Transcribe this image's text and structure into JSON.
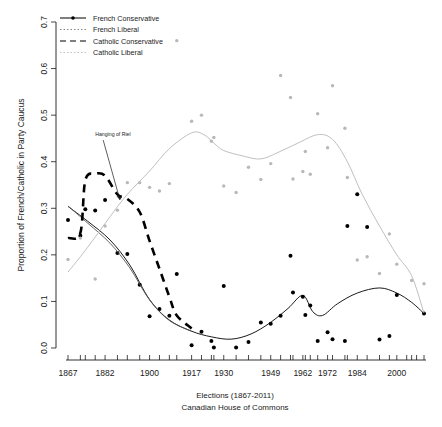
{
  "chart_data": {
    "type": "scatter",
    "title": "",
    "xlabel": "Elections (1867-2011)",
    "xlabel_line2": "Canadian House of Commons",
    "ylabel": "Proportion of French/Catholic in Party Caucus",
    "xlim": [
      1867,
      2011
    ],
    "ylim": [
      0.0,
      0.7
    ],
    "grid": false,
    "legend_position": "top-left",
    "y_ticks": [
      "0.0",
      "0.1",
      "0.2",
      "0.3",
      "0.4",
      "0.5",
      "0.6",
      "0.7"
    ],
    "y_tick_values": [
      0.0,
      0.1,
      0.2,
      0.3,
      0.4,
      0.5,
      0.6,
      0.7
    ],
    "x_tick_labels": [
      "1867",
      "1882",
      "1900",
      "1917",
      "1930",
      "1949",
      "1962",
      "1972",
      "1984",
      "2000"
    ],
    "x_tick_label_values": [
      1867,
      1882,
      1900,
      1917,
      1930,
      1949,
      1962,
      1972,
      1984,
      2000
    ],
    "election_years": [
      1867,
      1872,
      1874,
      1878,
      1882,
      1887,
      1891,
      1896,
      1900,
      1904,
      1908,
      1911,
      1917,
      1921,
      1925,
      1926,
      1930,
      1935,
      1940,
      1945,
      1949,
      1953,
      1957,
      1958,
      1962,
      1963,
      1965,
      1968,
      1972,
      1974,
      1979,
      1980,
      1984,
      1988,
      1993,
      1997,
      2000,
      2004,
      2006,
      2008,
      2011
    ],
    "annotations": [
      {
        "text": "Hanging of Riel",
        "x": 1878,
        "y": 0.455,
        "arrow_to_x": 1888,
        "arrow_to_y": 0.318
      }
    ],
    "series": [
      {
        "name": "French Conservative",
        "color": "#000000",
        "line_style": "solid",
        "marker": "filled-circle",
        "points": [
          {
            "x": 1867,
            "y": 0.275
          },
          {
            "x": 1872,
            "y": 0.241
          },
          {
            "x": 1874,
            "y": 0.298
          },
          {
            "x": 1878,
            "y": 0.295
          },
          {
            "x": 1882,
            "y": 0.318
          },
          {
            "x": 1887,
            "y": 0.204
          },
          {
            "x": 1891,
            "y": 0.202
          },
          {
            "x": 1896,
            "y": 0.136
          },
          {
            "x": 1900,
            "y": 0.068
          },
          {
            "x": 1904,
            "y": 0.084
          },
          {
            "x": 1908,
            "y": 0.069
          },
          {
            "x": 1911,
            "y": 0.159
          },
          {
            "x": 1917,
            "y": 0.006
          },
          {
            "x": 1921,
            "y": 0.035
          },
          {
            "x": 1925,
            "y": 0.015
          },
          {
            "x": 1926,
            "y": 0.001
          },
          {
            "x": 1930,
            "y": 0.133
          },
          {
            "x": 1935,
            "y": 0.001
          },
          {
            "x": 1940,
            "y": 0.013
          },
          {
            "x": 1945,
            "y": 0.055
          },
          {
            "x": 1949,
            "y": 0.052
          },
          {
            "x": 1953,
            "y": 0.069
          },
          {
            "x": 1957,
            "y": 0.198
          },
          {
            "x": 1958,
            "y": 0.119
          },
          {
            "x": 1962,
            "y": 0.11
          },
          {
            "x": 1963,
            "y": 0.071
          },
          {
            "x": 1965,
            "y": 0.091
          },
          {
            "x": 1968,
            "y": 0.015
          },
          {
            "x": 1972,
            "y": 0.034
          },
          {
            "x": 1974,
            "y": 0.019
          },
          {
            "x": 1979,
            "y": 0.015
          },
          {
            "x": 1980,
            "y": 0.262
          },
          {
            "x": 1984,
            "y": 0.33
          },
          {
            "x": 1988,
            "y": 0.26
          },
          {
            "x": 1993,
            "y": 0.018
          },
          {
            "x": 1997,
            "y": 0.026
          },
          {
            "x": 2000,
            "y": 0.114
          },
          {
            "x": 2011,
            "y": 0.074
          }
        ],
        "smooth": [
          {
            "x": 1867,
            "y": 0.304
          },
          {
            "x": 1875,
            "y": 0.272
          },
          {
            "x": 1884,
            "y": 0.232
          },
          {
            "x": 1892,
            "y": 0.178
          },
          {
            "x": 1900,
            "y": 0.104
          },
          {
            "x": 1908,
            "y": 0.06
          },
          {
            "x": 1917,
            "y": 0.036
          },
          {
            "x": 1925,
            "y": 0.024
          },
          {
            "x": 1933,
            "y": 0.019
          },
          {
            "x": 1941,
            "y": 0.03
          },
          {
            "x": 1949,
            "y": 0.055
          },
          {
            "x": 1956,
            "y": 0.085
          },
          {
            "x": 1962,
            "y": 0.113
          },
          {
            "x": 1966,
            "y": 0.078
          },
          {
            "x": 1970,
            "y": 0.07
          },
          {
            "x": 1976,
            "y": 0.095
          },
          {
            "x": 1984,
            "y": 0.118
          },
          {
            "x": 1993,
            "y": 0.129
          },
          {
            "x": 2000,
            "y": 0.118
          },
          {
            "x": 2006,
            "y": 0.098
          },
          {
            "x": 2011,
            "y": 0.074
          }
        ]
      },
      {
        "name": "French Liberal",
        "color": "#555555",
        "line_style": "solid",
        "marker": "small-dot",
        "points": [],
        "smooth": [
          {
            "x": 1867,
            "y": 0.305
          },
          {
            "x": 1875,
            "y": 0.268
          },
          {
            "x": 1884,
            "y": 0.225
          },
          {
            "x": 1892,
            "y": 0.172
          },
          {
            "x": 1900,
            "y": 0.103
          },
          {
            "x": 1908,
            "y": 0.059
          },
          {
            "x": 1917,
            "y": 0.036
          }
        ]
      },
      {
        "name": "Catholic Conservative",
        "color": "#000000",
        "line_style": "dashed",
        "marker": "none",
        "points": [],
        "smooth": [
          {
            "x": 1867,
            "y": 0.236
          },
          {
            "x": 1872,
            "y": 0.247
          },
          {
            "x": 1874,
            "y": 0.36
          },
          {
            "x": 1878,
            "y": 0.374
          },
          {
            "x": 1882,
            "y": 0.37
          },
          {
            "x": 1887,
            "y": 0.33
          },
          {
            "x": 1891,
            "y": 0.32
          },
          {
            "x": 1896,
            "y": 0.292
          },
          {
            "x": 1900,
            "y": 0.23
          },
          {
            "x": 1904,
            "y": 0.17
          },
          {
            "x": 1908,
            "y": 0.11
          },
          {
            "x": 1911,
            "y": 0.07
          },
          {
            "x": 1917,
            "y": 0.042
          }
        ]
      },
      {
        "name": "Catholic Liberal",
        "color": "#b8b8b8",
        "line_style": "solid",
        "marker": "small-dot",
        "points": [
          {
            "x": 1867,
            "y": 0.19
          },
          {
            "x": 1872,
            "y": 0.236
          },
          {
            "x": 1878,
            "y": 0.148
          },
          {
            "x": 1882,
            "y": 0.262
          },
          {
            "x": 1887,
            "y": 0.296
          },
          {
            "x": 1891,
            "y": 0.355
          },
          {
            "x": 1896,
            "y": 0.355
          },
          {
            "x": 1900,
            "y": 0.345
          },
          {
            "x": 1904,
            "y": 0.337
          },
          {
            "x": 1908,
            "y": 0.353
          },
          {
            "x": 1911,
            "y": 0.66
          },
          {
            "x": 1917,
            "y": 0.487
          },
          {
            "x": 1921,
            "y": 0.5
          },
          {
            "x": 1925,
            "y": 0.444
          },
          {
            "x": 1926,
            "y": 0.452
          },
          {
            "x": 1930,
            "y": 0.348
          },
          {
            "x": 1935,
            "y": 0.334
          },
          {
            "x": 1940,
            "y": 0.388
          },
          {
            "x": 1945,
            "y": 0.362
          },
          {
            "x": 1949,
            "y": 0.396
          },
          {
            "x": 1953,
            "y": 0.585
          },
          {
            "x": 1957,
            "y": 0.538
          },
          {
            "x": 1958,
            "y": 0.363
          },
          {
            "x": 1962,
            "y": 0.379
          },
          {
            "x": 1963,
            "y": 0.422
          },
          {
            "x": 1965,
            "y": 0.373
          },
          {
            "x": 1968,
            "y": 0.503
          },
          {
            "x": 1972,
            "y": 0.43
          },
          {
            "x": 1974,
            "y": 0.563
          },
          {
            "x": 1979,
            "y": 0.472
          },
          {
            "x": 1980,
            "y": 0.366
          },
          {
            "x": 1984,
            "y": 0.189
          },
          {
            "x": 1988,
            "y": 0.196
          },
          {
            "x": 1993,
            "y": 0.16
          },
          {
            "x": 1997,
            "y": 0.245
          },
          {
            "x": 2000,
            "y": 0.18
          },
          {
            "x": 2006,
            "y": 0.145
          },
          {
            "x": 2011,
            "y": 0.138
          }
        ],
        "smooth": [
          {
            "x": 1867,
            "y": 0.163
          },
          {
            "x": 1872,
            "y": 0.196
          },
          {
            "x": 1878,
            "y": 0.238
          },
          {
            "x": 1884,
            "y": 0.282
          },
          {
            "x": 1891,
            "y": 0.33
          },
          {
            "x": 1900,
            "y": 0.38
          },
          {
            "x": 1908,
            "y": 0.428
          },
          {
            "x": 1917,
            "y": 0.462
          },
          {
            "x": 1922,
            "y": 0.458
          },
          {
            "x": 1926,
            "y": 0.44
          },
          {
            "x": 1930,
            "y": 0.424
          },
          {
            "x": 1938,
            "y": 0.412
          },
          {
            "x": 1945,
            "y": 0.406
          },
          {
            "x": 1952,
            "y": 0.42
          },
          {
            "x": 1960,
            "y": 0.44
          },
          {
            "x": 1968,
            "y": 0.458
          },
          {
            "x": 1974,
            "y": 0.448
          },
          {
            "x": 1980,
            "y": 0.4
          },
          {
            "x": 1986,
            "y": 0.33
          },
          {
            "x": 1993,
            "y": 0.262
          },
          {
            "x": 2000,
            "y": 0.2
          },
          {
            "x": 2006,
            "y": 0.155
          },
          {
            "x": 2011,
            "y": 0.075
          }
        ]
      }
    ]
  },
  "legend": {
    "items": [
      {
        "label": "French Conservative",
        "style": "solid-with-marker",
        "color": "#000000"
      },
      {
        "label": "French Liberal",
        "style": "dotted-gray",
        "color": "#888888"
      },
      {
        "label": "Catholic Conservative",
        "style": "dashed",
        "color": "#000000"
      },
      {
        "label": "Catholic Liberal",
        "style": "solid-light",
        "color": "#c0c0c0"
      }
    ]
  }
}
